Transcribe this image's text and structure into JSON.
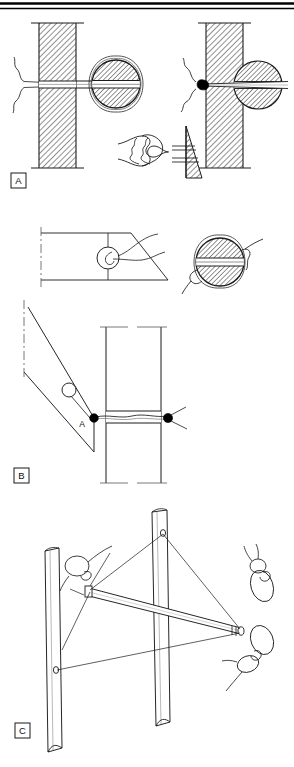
{
  "figure": {
    "top_rule": {
      "present": true,
      "style": "double-horizontal-rule",
      "color": "#000000"
    },
    "background_color": "#ffffff",
    "line_color": "#1a1a1a",
    "hatch_color": "#4a4a4a",
    "knot_color": "#000000",
    "panels": [
      {
        "id": "A",
        "label": "A",
        "description": "Suture passed through bone tunnel and around graft; left shows free suture, right shows knotted suture; inset shows knot against bone wedge",
        "elements": [
          {
            "name": "left-bone-wall",
            "type": "hatched-column"
          },
          {
            "name": "left-graft-circle",
            "type": "hatched-circle-with-ring"
          },
          {
            "name": "left-suture-strand",
            "type": "thread"
          },
          {
            "name": "right-bone-wall",
            "type": "hatched-column"
          },
          {
            "name": "right-graft-circle",
            "type": "hatched-circle"
          },
          {
            "name": "right-suture-knot",
            "type": "knot-dot"
          },
          {
            "name": "knot-detail-inset",
            "type": "knot-with-wedge"
          }
        ]
      },
      {
        "id": "B",
        "label": "B",
        "description": "Angled bone block with drill hole at point A; suture passes through transverse tunnel and is tied with knots on both sides",
        "point_label": "A",
        "elements": [
          {
            "name": "angled-plane-top",
            "type": "parallelogram"
          },
          {
            "name": "plane-drill-circle",
            "type": "circle-outline"
          },
          {
            "name": "cross-section-circle",
            "type": "hatched-circle-with-ring"
          },
          {
            "name": "angled-bone-block",
            "type": "parallelogram"
          },
          {
            "name": "vertical-tunnel-tube",
            "type": "tube"
          },
          {
            "name": "knot-left",
            "type": "knot-dot"
          },
          {
            "name": "knot-right",
            "type": "knot-dot"
          }
        ]
      },
      {
        "id": "C",
        "label": "C",
        "description": "Two vertical bone posts with a diagonal crossbar pin; suture threads run between posts and pin, with three free knots illustrated",
        "elements": [
          {
            "name": "left-post",
            "type": "post"
          },
          {
            "name": "right-post",
            "type": "post"
          },
          {
            "name": "diagonal-crossbar",
            "type": "pin"
          },
          {
            "name": "suture-line-upper",
            "type": "thread"
          },
          {
            "name": "suture-line-lower",
            "type": "thread"
          },
          {
            "name": "knot-upper-left",
            "type": "loop-knot"
          },
          {
            "name": "knot-right-upper",
            "type": "loop-knot"
          },
          {
            "name": "knot-right-lower",
            "type": "loop-knot"
          }
        ]
      }
    ]
  }
}
